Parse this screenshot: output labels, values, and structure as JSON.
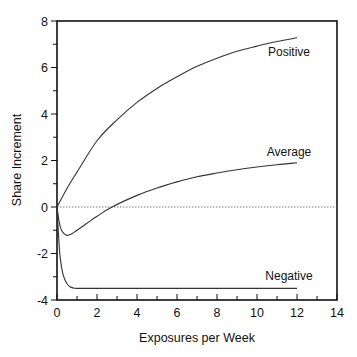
{
  "chart_data": {
    "type": "line",
    "title": "",
    "xlabel": "Exposures per Week",
    "ylabel": "Share Increment",
    "xlim": [
      0,
      14
    ],
    "ylim": [
      -4,
      8
    ],
    "x_ticks": [
      0,
      2,
      4,
      6,
      8,
      10,
      12,
      14
    ],
    "y_ticks": [
      8,
      6,
      4,
      2,
      0,
      -2,
      -4
    ],
    "x_tick_labels": [
      "0",
      "2",
      "4",
      "6",
      "8",
      "10",
      "12",
      "14"
    ],
    "y_tick_labels": [
      "8",
      "6",
      "4",
      "2",
      "0",
      "-2",
      "-4"
    ],
    "grid": false,
    "reference_line": {
      "y": 0,
      "style": "dotted"
    },
    "legend": "inline labels",
    "series": [
      {
        "name": "Positive",
        "label_pos": [
          10.0,
          6.5
        ],
        "x": [
          0,
          0.5,
          1,
          2,
          3,
          4,
          5,
          6,
          7,
          8,
          9,
          10,
          11,
          12
        ],
        "values": [
          0,
          0.8,
          1.5,
          2.85,
          3.75,
          4.5,
          5.1,
          5.6,
          6.05,
          6.4,
          6.7,
          6.92,
          7.12,
          7.28
        ]
      },
      {
        "name": "Average",
        "label_pos": [
          10.0,
          2.2
        ],
        "x": [
          0,
          0.1,
          0.2,
          0.35,
          0.5,
          0.75,
          1,
          1.5,
          2,
          2.75,
          4,
          5,
          6,
          7,
          8,
          9,
          10,
          11,
          12
        ],
        "values": [
          0,
          -0.6,
          -0.95,
          -1.15,
          -1.22,
          -1.15,
          -1.0,
          -0.7,
          -0.4,
          0,
          0.5,
          0.82,
          1.08,
          1.3,
          1.46,
          1.6,
          1.72,
          1.82,
          1.9
        ]
      },
      {
        "name": "Negative",
        "label_pos": [
          10.0,
          -3.15
        ],
        "x": [
          0,
          0.05,
          0.1,
          0.15,
          0.23,
          0.3,
          0.4,
          0.5,
          0.65,
          0.8,
          1,
          1.5,
          2,
          4,
          6,
          8,
          10,
          12
        ],
        "values": [
          0,
          -0.8,
          -1.55,
          -2.1,
          -2.6,
          -2.9,
          -3.14,
          -3.3,
          -3.43,
          -3.48,
          -3.5,
          -3.5,
          -3.5,
          -3.5,
          -3.5,
          -3.5,
          -3.5,
          -3.5
        ]
      }
    ]
  },
  "style": {
    "line_color": "#333333",
    "axis_color": "#111111",
    "background": "#ffffff"
  }
}
